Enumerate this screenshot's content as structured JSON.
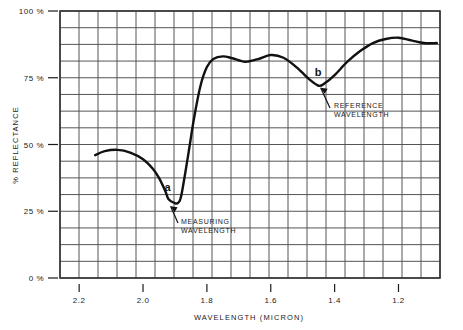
{
  "chart_data": {
    "type": "line",
    "title": "",
    "xlabel": "WAVELENGTH (MICRON)",
    "ylabel": "% REFLECTANCE",
    "xlim": [
      2.26,
      1.07
    ],
    "ylim": [
      0,
      100
    ],
    "x_reversed": true,
    "grid": true,
    "grid_columns": 20,
    "grid_rows": 16,
    "legend": "none",
    "xticks": [
      2.2,
      2.0,
      1.8,
      1.6,
      1.4,
      1.2
    ],
    "xtick_labels": [
      "2.2",
      "2.0",
      "1.8",
      "1.6",
      "1.4",
      "1.2"
    ],
    "yticks": [
      0,
      25,
      50,
      75,
      100
    ],
    "ytick_labels": [
      "0 %",
      "25 %",
      "50 %",
      "75 %",
      "100 %"
    ],
    "series": [
      {
        "name": "reflectance-spectrum",
        "x": [
          2.15,
          2.12,
          2.08,
          2.04,
          2.0,
          1.97,
          1.95,
          1.93,
          1.92,
          1.9,
          1.89,
          1.88,
          1.86,
          1.84,
          1.82,
          1.8,
          1.78,
          1.75,
          1.72,
          1.68,
          1.64,
          1.6,
          1.56,
          1.52,
          1.48,
          1.45,
          1.43,
          1.4,
          1.36,
          1.32,
          1.28,
          1.24,
          1.2,
          1.16,
          1.12,
          1.08
        ],
        "y": [
          46.0,
          47.5,
          48.0,
          47.0,
          44.5,
          41.0,
          37.5,
          32.5,
          29.5,
          28.0,
          28.2,
          31.0,
          45.0,
          60.0,
          72.0,
          79.0,
          82.0,
          83.0,
          82.3,
          81.0,
          82.0,
          83.5,
          82.5,
          79.0,
          74.5,
          72.0,
          73.0,
          76.0,
          81.0,
          85.0,
          88.0,
          89.5,
          90.0,
          89.0,
          88.0,
          88.0
        ]
      }
    ],
    "annotations": [
      {
        "id": "a",
        "label": "a",
        "text": "MEASURING\nWAVELENGTH",
        "text_line1": "MEASURING",
        "text_line2": "WAVELENGTH",
        "x": 1.92,
        "y": 28.0
      },
      {
        "id": "b",
        "label": "b",
        "text": "REFERENCE\nWAVELENGTH",
        "text_line1": "REFERENCE",
        "text_line2": "WAVELENGTH",
        "x": 1.45,
        "y": 72.0
      }
    ],
    "colors": {
      "curve": "#111111",
      "grid": "#555555",
      "border": "#333333",
      "background": "#ffffff",
      "text": "#1a1a1a"
    }
  }
}
